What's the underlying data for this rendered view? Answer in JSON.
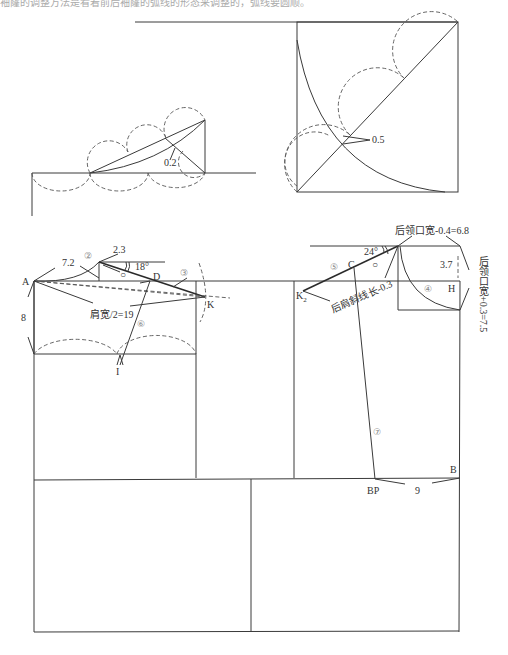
{
  "caption": "袖窿的调整方法是看着前后袖窿的弧线的形态来调整的，弧线要圆顺。",
  "detail_left": {
    "label_0_2": "0.2"
  },
  "detail_right": {
    "label_0_5": "0.5"
  },
  "front": {
    "point_A": "A",
    "point_D": "D",
    "point_K": "K",
    "point_I": "I",
    "dim_7_2": "7.2",
    "dim_2_3": "2.3",
    "angle_18": "18°",
    "dim_8": "8",
    "shoulder_width": "肩宽/2=19",
    "step_2": "②",
    "step_3": "③",
    "step_6": "⑥",
    "circle_mark": "○"
  },
  "back": {
    "point_C": "C",
    "point_K2": "K",
    "point_K2_sub": "2",
    "point_H": "H",
    "point_BP": "BP",
    "point_B": "B",
    "angle_24": "24°",
    "dim_3_7": "3.7",
    "dim_9": "9",
    "back_neck_width": "后领口宽-0.4=6.8",
    "back_neck_depth": "后领口宽+0.3=7.5",
    "back_shoulder": "后肩斜线长-0.3",
    "step_4": "④",
    "step_5": "⑤",
    "step_7": "⑦",
    "circle_mark": "○"
  }
}
